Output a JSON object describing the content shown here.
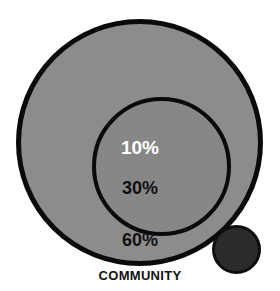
{
  "caption": "COMMUNITY",
  "colors": {
    "background": "#ffffff",
    "outer_ring_fill": "#8c8c8c",
    "middle_ring_fill": "#878787",
    "inner_core_fill": "#2b2b2b",
    "stroke": "#0a0a0a",
    "inner_label_text": "#ffffff",
    "outer_label_text": "#111111"
  },
  "chart_data": {
    "type": "pie",
    "title": "COMMUNITY",
    "subtitle": "",
    "xlabel": "",
    "ylabel": "",
    "legend_position": "none",
    "grid": false,
    "layout": "concentric-circles",
    "categories": [
      "10%",
      "30%",
      "60%"
    ],
    "values": [
      10,
      30,
      60
    ],
    "labels": [
      "10%",
      "30%",
      "60%"
    ],
    "series": [
      {
        "name": "Community layers",
        "values": [
          10,
          30,
          60
        ]
      }
    ],
    "rings": [
      {
        "label": "10%",
        "value": 10,
        "position": "inner",
        "fill": "#2b2b2b",
        "text_color": "#ffffff"
      },
      {
        "label": "30%",
        "value": 30,
        "position": "middle",
        "fill": "#878787",
        "text_color": "#111111"
      },
      {
        "label": "60%",
        "value": 60,
        "position": "outer",
        "fill": "#8c8c8c",
        "text_color": "#111111"
      }
    ],
    "annotations": [
      "COMMUNITY"
    ]
  }
}
